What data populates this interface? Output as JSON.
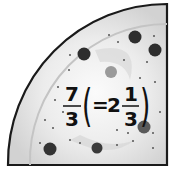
{
  "figure": {
    "shape": "quarter-circle pizza slice",
    "colors": {
      "outline": "#1a1a1a",
      "crust": "#d6d6d6",
      "cheese": "#e8e8e8",
      "center_glow": "#fafafa",
      "topping_dark": "#2e2e2e",
      "topping_mid": "#5a5a5a",
      "topping_light": "#9a9a9a"
    }
  },
  "label": {
    "improper_numerator": "7",
    "improper_denominator": "3",
    "open_paren": "(",
    "equals": "=",
    "whole": "2",
    "mixed_numerator": "1",
    "mixed_denominator": "3",
    "close_paren": ")"
  }
}
